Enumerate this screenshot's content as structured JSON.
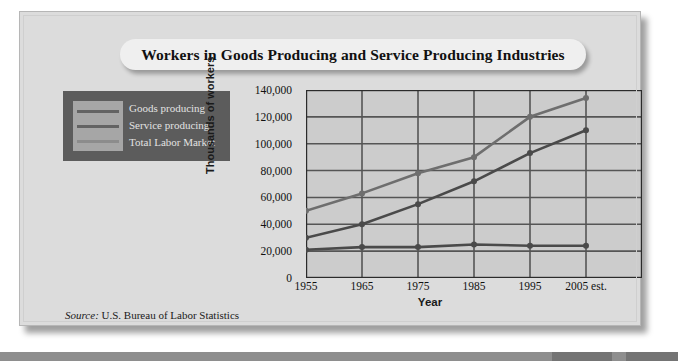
{
  "figure": {
    "title": "Workers in Goods Producing and Service Producing Industries",
    "source_lead": "Source:",
    "source_text": " U.S. Bureau of Labor Statistics"
  },
  "legend": {
    "items": [
      {
        "label": "Goods producing",
        "color": "#4a4a4a"
      },
      {
        "label": "Service producing",
        "color": "#4a4a4a"
      },
      {
        "label": "Total Labor Market",
        "color": "#6e6e6e"
      }
    ]
  },
  "colors": {
    "panel_background": "#dcdcdc",
    "plot_background": "#cccccc",
    "legend_background": "#5c5c5c",
    "legend_swatch_panel": "#a6a6a6",
    "axis": "#2b2b2b",
    "grid": "#555555",
    "title_pill": "#efefef"
  },
  "chart_data": {
    "type": "line",
    "title": "Workers in Goods Producing and Service Producing Industries",
    "xlabel": "Year",
    "ylabel": "Thousands of workers",
    "categories": [
      "1955",
      "1965",
      "1975",
      "1985",
      "1995",
      "2005 est."
    ],
    "x_tick_labels": [
      "1955",
      "1965",
      "1975",
      "1985",
      "1995",
      "2005 est."
    ],
    "y_tick_labels": [
      "0",
      "20,000",
      "40,000",
      "60,000",
      "80,000",
      "100,000",
      "120,000",
      "140,000"
    ],
    "y_tick_values": [
      0,
      20000,
      40000,
      60000,
      80000,
      100000,
      120000,
      140000
    ],
    "ylim": [
      0,
      140000
    ],
    "grid": true,
    "legend_position": "outside-left",
    "series": [
      {
        "name": "Total Labor Market",
        "color": "#6e6e6e",
        "values": [
          50000,
          63000,
          78000,
          90000,
          120000,
          134000
        ]
      },
      {
        "name": "Service producing",
        "color": "#4a4a4a",
        "values": [
          30000,
          40000,
          55000,
          72000,
          93000,
          110000
        ]
      },
      {
        "name": "Goods producing",
        "color": "#4a4a4a",
        "values": [
          21000,
          23000,
          23000,
          25000,
          24000,
          24000
        ]
      }
    ]
  }
}
